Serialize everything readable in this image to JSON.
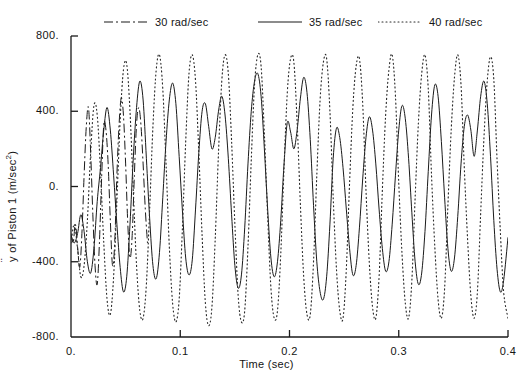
{
  "chart_data": {
    "type": "line",
    "title": "",
    "xlabel": "Time (sec)",
    "ylabel": "ÿ of  Piston 1 (m/sec²)",
    "ylabel_symbol": "y",
    "ylabel_rest": " of  Piston 1 (m/sec",
    "ylabel_sup": "2",
    "ylabel_close": ")",
    "xlim": [
      0,
      0.4
    ],
    "ylim": [
      -800,
      800
    ],
    "xticks": [
      0,
      0.1,
      0.2,
      0.3,
      0.4
    ],
    "xticklabels": [
      "0.",
      "0.1",
      "0.2",
      "0.3",
      "0.4"
    ],
    "yticks": [
      800,
      400,
      0,
      -400,
      -800
    ],
    "yticklabels": [
      "800.",
      "400.",
      "0.",
      "-400.",
      "-800."
    ],
    "grid": false,
    "legend_position": "top",
    "series": [
      {
        "name": "30 rad/sec",
        "label": "30 rad/sec",
        "linestyle": "dashdot",
        "color": "#1a1a1a",
        "dasharray": "9,3,2,3",
        "x": [
          0.0,
          0.002,
          0.004,
          0.006,
          0.008,
          0.01,
          0.012,
          0.014,
          0.016,
          0.018,
          0.02,
          0.022,
          0.024,
          0.026,
          0.028,
          0.03,
          0.032,
          0.034,
          0.036,
          0.038,
          0.04,
          0.042,
          0.044,
          0.046,
          0.048,
          0.05,
          0.052,
          0.054,
          0.056,
          0.058,
          0.06,
          0.062,
          0.064,
          0.066,
          0.068,
          0.07
        ],
        "y": [
          -250,
          -300,
          -200,
          -320,
          -430,
          -250,
          60,
          320,
          420,
          180,
          -150,
          -420,
          -520,
          -300,
          40,
          330,
          300,
          120,
          -180,
          -420,
          -300,
          60,
          330,
          470,
          380,
          120,
          -200,
          -380,
          -260,
          60,
          330,
          420,
          330,
          120,
          -120,
          -300
        ]
      },
      {
        "name": "35 rad/sec",
        "label": "35 rad/sec",
        "linestyle": "solid",
        "color": "#1a1a1a",
        "dasharray": "",
        "x": [
          0.0,
          0.003,
          0.006,
          0.009,
          0.012,
          0.015,
          0.018,
          0.021,
          0.024,
          0.027,
          0.03,
          0.033,
          0.036,
          0.039,
          0.042,
          0.045,
          0.048,
          0.051,
          0.054,
          0.057,
          0.06,
          0.063,
          0.066,
          0.069,
          0.072,
          0.075,
          0.078,
          0.081,
          0.084,
          0.087,
          0.09,
          0.093,
          0.096,
          0.099,
          0.102,
          0.105,
          0.108,
          0.111,
          0.114,
          0.117,
          0.12,
          0.123,
          0.126,
          0.129,
          0.132,
          0.135,
          0.138,
          0.141,
          0.144,
          0.147,
          0.15,
          0.153,
          0.156,
          0.159,
          0.162,
          0.165,
          0.168,
          0.171,
          0.174,
          0.177,
          0.18,
          0.183,
          0.186,
          0.189,
          0.192,
          0.195,
          0.198,
          0.201,
          0.204,
          0.207,
          0.21,
          0.213,
          0.216,
          0.219,
          0.222,
          0.225,
          0.228,
          0.231,
          0.234,
          0.237,
          0.24,
          0.243,
          0.246,
          0.249,
          0.252,
          0.255,
          0.258,
          0.261,
          0.264,
          0.267,
          0.27,
          0.273,
          0.276,
          0.279,
          0.282,
          0.285,
          0.288,
          0.291,
          0.294,
          0.297,
          0.3,
          0.303,
          0.306,
          0.309,
          0.312,
          0.315,
          0.318,
          0.321,
          0.324,
          0.327,
          0.33,
          0.333,
          0.336,
          0.339,
          0.342,
          0.345,
          0.348,
          0.351,
          0.354,
          0.357,
          0.36,
          0.363,
          0.366,
          0.369,
          0.372,
          0.375,
          0.378,
          0.381,
          0.384,
          0.387,
          0.39,
          0.393,
          0.396,
          0.4
        ],
        "y": [
          -260,
          -300,
          -250,
          -150,
          -240,
          -400,
          -460,
          -330,
          -80,
          100,
          300,
          420,
          300,
          60,
          -200,
          -430,
          -560,
          -480,
          -200,
          150,
          420,
          560,
          460,
          150,
          -170,
          -420,
          -490,
          -350,
          -60,
          240,
          460,
          550,
          440,
          160,
          -130,
          -380,
          -470,
          -390,
          -120,
          180,
          400,
          440,
          320,
          200,
          260,
          400,
          480,
          380,
          150,
          -150,
          -420,
          -540,
          -470,
          -220,
          120,
          400,
          560,
          600,
          480,
          200,
          -120,
          -380,
          -480,
          -400,
          -180,
          120,
          340,
          290,
          200,
          300,
          470,
          580,
          500,
          250,
          -100,
          -400,
          -560,
          -600,
          -480,
          -200,
          150,
          310,
          260,
          100,
          -120,
          -330,
          -470,
          -420,
          -220,
          40,
          260,
          370,
          300,
          120,
          -120,
          -330,
          -450,
          -400,
          -200,
          60,
          300,
          430,
          360,
          150,
          -140,
          -400,
          -520,
          -460,
          -240,
          80,
          380,
          540,
          480,
          240,
          -60,
          -330,
          -450,
          -380,
          -160,
          120,
          320,
          380,
          300,
          160,
          300,
          480,
          560,
          440,
          160,
          -180,
          -440,
          -560,
          -500,
          -270
        ]
      },
      {
        "name": "40 rad/sec",
        "label": "40 rad/sec",
        "linestyle": "dotted",
        "color": "#2b2b2b",
        "dasharray": "1,3",
        "x": [
          0.0,
          0.003,
          0.006,
          0.009,
          0.012,
          0.015,
          0.018,
          0.021,
          0.024,
          0.027,
          0.03,
          0.033,
          0.036,
          0.039,
          0.042,
          0.045,
          0.048,
          0.051,
          0.054,
          0.057,
          0.06,
          0.063,
          0.066,
          0.069,
          0.072,
          0.075,
          0.078,
          0.081,
          0.084,
          0.087,
          0.09,
          0.093,
          0.096,
          0.099,
          0.102,
          0.105,
          0.108,
          0.111,
          0.114,
          0.117,
          0.12,
          0.123,
          0.126,
          0.129,
          0.132,
          0.135,
          0.138,
          0.141,
          0.144,
          0.147,
          0.15,
          0.153,
          0.156,
          0.159,
          0.162,
          0.165,
          0.168,
          0.171,
          0.174,
          0.177,
          0.18,
          0.183,
          0.186,
          0.189,
          0.192,
          0.195,
          0.198,
          0.201,
          0.204,
          0.207,
          0.21,
          0.213,
          0.216,
          0.219,
          0.222,
          0.225,
          0.228,
          0.231,
          0.234,
          0.237,
          0.24,
          0.243,
          0.246,
          0.249,
          0.252,
          0.255,
          0.258,
          0.261,
          0.264,
          0.267,
          0.27,
          0.273,
          0.276,
          0.279,
          0.282,
          0.285,
          0.288,
          0.291,
          0.294,
          0.297,
          0.3,
          0.303,
          0.306,
          0.309,
          0.312,
          0.315,
          0.318,
          0.321,
          0.324,
          0.327,
          0.33,
          0.333,
          0.336,
          0.339,
          0.342,
          0.345,
          0.348,
          0.351,
          0.354,
          0.357,
          0.36,
          0.363,
          0.366,
          0.369,
          0.372,
          0.375,
          0.378,
          0.381,
          0.384,
          0.387,
          0.39,
          0.393,
          0.396,
          0.4
        ],
        "y": [
          -300,
          -200,
          -330,
          -480,
          -420,
          -180,
          180,
          430,
          380,
          80,
          -300,
          -600,
          -680,
          -480,
          -80,
          350,
          620,
          650,
          400,
          -20,
          -420,
          -660,
          -700,
          -520,
          -120,
          320,
          620,
          700,
          520,
          120,
          -320,
          -620,
          -720,
          -600,
          -220,
          240,
          600,
          700,
          560,
          180,
          -260,
          -620,
          -740,
          -640,
          -280,
          180,
          560,
          700,
          600,
          240,
          -200,
          -580,
          -720,
          -660,
          -320,
          140,
          540,
          700,
          640,
          280,
          -160,
          -540,
          -700,
          -660,
          -360,
          100,
          500,
          680,
          660,
          340,
          -100,
          -480,
          -680,
          -680,
          -400,
          60,
          460,
          660,
          680,
          400,
          -60,
          -440,
          -660,
          -700,
          -440,
          20,
          420,
          640,
          680,
          440,
          -20,
          -400,
          -640,
          -700,
          -480,
          -20,
          380,
          620,
          700,
          480,
          20,
          -360,
          -620,
          -700,
          -500,
          -60,
          340,
          600,
          700,
          520,
          60,
          -320,
          -600,
          -700,
          -540,
          -100,
          300,
          580,
          700,
          540,
          100,
          -280,
          -580,
          -700,
          -560,
          -140,
          260,
          560,
          690,
          570,
          140,
          -240,
          -560,
          -700
        ]
      }
    ]
  },
  "axes": {
    "tick_color": "#1a1a1a",
    "frame_color": "#1a1a1a"
  }
}
